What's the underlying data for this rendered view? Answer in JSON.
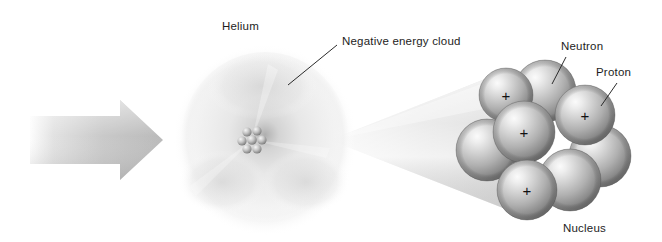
{
  "figure": {
    "background_color": "#ffffff",
    "width": 662,
    "height": 242
  },
  "labels": {
    "helium": "Helium",
    "negative_energy_cloud": "Negative energy cloud",
    "neutron": "Neutron",
    "proton": "Proton",
    "nucleus": "Nucleus"
  },
  "colors": {
    "text": "#1d1d1d",
    "leader_line": "#2b2b2b",
    "arrow_light": "#f3f3f3",
    "arrow_dark": "#b9b9b9",
    "cloud_outer": "#e9e9e9",
    "cloud_mid": "#d6d6d6",
    "cloud_inner": "#9d9d9d",
    "cone_fill": "#e4e4e4",
    "sphere_highlight": "#f2f2f2",
    "sphere_mid": "#b5b5b5",
    "sphere_dark": "#6e6e6e",
    "charge_sign": "#111111"
  },
  "arrow": {
    "name": "incoming-arrow",
    "direction": "right",
    "x_start": 30,
    "x_end": 163,
    "y_center": 140
  },
  "atom": {
    "name": "helium-atom",
    "center_x": 265,
    "center_y": 140,
    "radius_x": 84,
    "radius_y": 88,
    "core_x": 252,
    "core_y": 140,
    "core_radius": 12,
    "core_nucleon_count": 7
  },
  "magnifier_cone": {
    "name": "magnification-cone",
    "apex_x": 330,
    "apex_y": 140,
    "base_x": 505,
    "base_top_y": 72,
    "base_bottom_y": 208
  },
  "nucleus": {
    "name": "magnified-nucleus",
    "particle_counts": {
      "protons": 4,
      "neutrons": 4,
      "total_visible": 8
    },
    "charge_symbol": "+",
    "particles": [
      {
        "id": "neutron-back-left",
        "type": "neutron",
        "cx": 487,
        "cy": 150,
        "r": 31,
        "charge": "",
        "z": 1
      },
      {
        "id": "neutron-back-right",
        "type": "neutron",
        "cx": 600,
        "cy": 156,
        "r": 31,
        "charge": "",
        "z": 1
      },
      {
        "id": "neutron-top-center",
        "type": "neutron",
        "cx": 545,
        "cy": 91,
        "r": 31,
        "charge": "",
        "z": 2
      },
      {
        "id": "proton-top-left",
        "type": "proton",
        "cx": 506,
        "cy": 95,
        "r": 27,
        "charge": "+",
        "z": 3
      },
      {
        "id": "proton-right",
        "type": "proton",
        "cx": 585,
        "cy": 115,
        "r": 30,
        "charge": "+",
        "z": 3
      },
      {
        "id": "proton-center",
        "type": "proton",
        "cx": 524,
        "cy": 132,
        "r": 31,
        "charge": "+",
        "z": 4
      },
      {
        "id": "neutron-bottom-mid",
        "type": "neutron",
        "cx": 570,
        "cy": 180,
        "r": 31,
        "charge": "",
        "z": 4
      },
      {
        "id": "proton-bottom-left",
        "type": "proton",
        "cx": 527,
        "cy": 190,
        "r": 30,
        "charge": "+",
        "z": 5
      }
    ]
  },
  "leader_lines": [
    {
      "name": "leader-negative-energy-cloud",
      "x1": 288,
      "y1": 85,
      "x2": 337,
      "y2": 45
    },
    {
      "name": "leader-neutron",
      "x1": 552,
      "y1": 84,
      "x2": 566,
      "y2": 57
    },
    {
      "name": "leader-proton",
      "x1": 601,
      "y1": 106,
      "x2": 617,
      "y2": 83
    }
  ],
  "label_positions": {
    "helium": {
      "x": 222,
      "y": 20
    },
    "negative_energy_cloud": {
      "x": 342,
      "y": 35
    },
    "neutron": {
      "x": 561,
      "y": 40
    },
    "proton": {
      "x": 596,
      "y": 66
    },
    "nucleus": {
      "x": 563,
      "y": 222
    }
  }
}
